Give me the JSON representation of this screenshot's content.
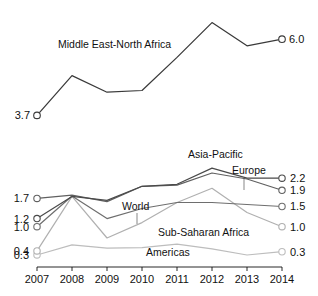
{
  "figure": {
    "background_color": "#ffffff",
    "text_color": "#111111"
  },
  "chart_data": [
    {
      "type": "line",
      "panel": "top",
      "title": "",
      "xlabel": "",
      "ylabel": "",
      "grid": false,
      "legend_position": "inline-label",
      "x": [
        2007,
        2008,
        2009,
        2010,
        2011,
        2012,
        2013,
        2014
      ],
      "xlim": [
        2007,
        2014
      ],
      "ylim": [
        3.5,
        6.7
      ],
      "axis_visible": false,
      "series": [
        {
          "name": "Middle East-North Africa",
          "color": "#3a3a3a",
          "label_inline": "Middle East-North Africa",
          "start_label": "3.7",
          "end_label": "6.0",
          "values": [
            3.7,
            4.9,
            4.4,
            4.45,
            5.45,
            6.5,
            5.8,
            6.0
          ],
          "markers": [
            "start",
            "end"
          ]
        }
      ]
    },
    {
      "type": "line",
      "panel": "bottom",
      "title": "",
      "xlabel": "",
      "ylabel": "",
      "grid": false,
      "legend_position": "inline-label",
      "axis_visible": true,
      "x": [
        2007,
        2008,
        2009,
        2010,
        2011,
        2012,
        2013,
        2014
      ],
      "xlim": [
        2007,
        2014
      ],
      "ylim": [
        0.2,
        2.75
      ],
      "tick_labels": [
        "2007",
        "2008",
        "2009",
        "2010",
        "2011",
        "2012",
        "2013",
        "2014"
      ],
      "start_value_labels": [
        "1.7",
        "1.2",
        "1.0",
        "0.4",
        "0.3"
      ],
      "end_value_labels": [
        "2.2",
        "1.9",
        "1.5",
        "1.0",
        "0.3"
      ],
      "series": [
        {
          "name": "Asia-Pacific",
          "color": "#4a4a4a",
          "label_inline": "Asia-Pacific",
          "start_label": "1.2",
          "end_label": "2.2",
          "values": [
            1.2,
            1.75,
            1.65,
            2.0,
            2.05,
            2.45,
            2.2,
            2.2
          ],
          "markers": [
            "start",
            "end"
          ]
        },
        {
          "name": "Europe",
          "color": "#606060",
          "label_inline": "Europe",
          "start_label": "1.7",
          "end_label": "1.9",
          "values": [
            1.7,
            1.78,
            1.62,
            2.0,
            2.03,
            2.33,
            2.18,
            1.9
          ],
          "markers": [
            "start",
            "end"
          ]
        },
        {
          "name": "World",
          "color": "#6e6e6e",
          "label_inline": "World",
          "start_label": "1.2",
          "end_label": "1.5",
          "values": [
            1.0,
            1.76,
            1.2,
            1.45,
            1.6,
            1.6,
            1.55,
            1.5
          ],
          "markers": [
            "start",
            "end"
          ]
        },
        {
          "name": "Sub-Saharan Africa",
          "color": "#b0b0b0",
          "label_inline": "Sub-Saharan Africa",
          "start_label": "0.4",
          "end_label": "1.0",
          "values": [
            0.4,
            1.75,
            0.72,
            1.1,
            1.6,
            1.95,
            1.35,
            1.0
          ],
          "markers": [
            "start",
            "end"
          ]
        },
        {
          "name": "Americas",
          "color": "#bdbdbd",
          "label_inline": "Americas",
          "start_label": "0.3",
          "end_label": "0.3",
          "values": [
            0.3,
            0.55,
            0.47,
            0.48,
            0.57,
            0.45,
            0.3,
            0.38
          ],
          "markers": [
            "start",
            "end"
          ]
        }
      ]
    }
  ]
}
